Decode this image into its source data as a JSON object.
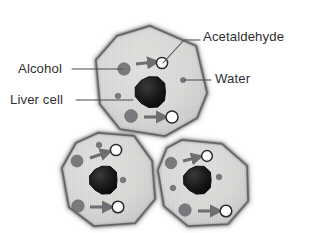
{
  "figure": {
    "background_color": "#ffffff",
    "top_clipped_text": "alcohol is broken down in liver cells",
    "label_color": "#2f2f33",
    "leader_color": "#4a4a50"
  },
  "labels": [
    {
      "id": "acetaldehyde",
      "text": "Acetaldehyde",
      "name": "label-acetaldehyde",
      "x": 203,
      "y": 41,
      "anchor": "start"
    },
    {
      "id": "water",
      "text": "Water",
      "name": "label-water",
      "x": 215,
      "y": 83,
      "anchor": "start"
    },
    {
      "id": "alcohol",
      "text": "Alcohol",
      "name": "label-alcohol",
      "x": 18,
      "y": 73,
      "anchor": "start"
    },
    {
      "id": "liver_cell",
      "text": "Liver cell",
      "name": "label-liver-cell",
      "x": 10,
      "y": 104,
      "anchor": "start"
    }
  ],
  "leaders": [
    {
      "id": "acetaldehyde-leader",
      "path": "M 163 63 L 184 40 L 200 40",
      "target": "acetaldehyde-molecule-top"
    },
    {
      "id": "water-leader",
      "path": "M 184 80 L 211 80",
      "target": "water-molecule-top"
    },
    {
      "id": "alcohol-leader",
      "path": "M 72 69 L 123 69",
      "target": "alcohol-molecule-top"
    },
    {
      "id": "liver-cell-leader",
      "path": "M 76 100 L 133 100",
      "target": "liver-cell-top"
    }
  ],
  "legend_meaning": {
    "alcohol": "large gray filled circle",
    "acetaldehyde": "white circle with dark outline",
    "water": "small gray filled circle",
    "nucleus": "large dark mottled blob",
    "arrow": "gray arrow showing conversion"
  },
  "colors": {
    "cell_fill": "#d5d5d3",
    "cell_fill_light": "#e3e3e1",
    "cell_outline": "#5a5a5c",
    "cell_outline_soft": "#8e8e90",
    "nucleus": "#1c1c1c",
    "nucleus_edge": "#0d0d0d",
    "molecule_gray": "#7a7a7e",
    "molecule_white": "#ffffff",
    "molecule_white_edge": "#2a2a2c",
    "arrow": "#6f6f73",
    "stripe": "#c8c8c6"
  },
  "cells": [
    {
      "id": "cell-top",
      "name": "liver-cell-top",
      "outline_path": "M 150 26 L 196 46 L 207 93 L 197 118 L 165 136 L 120 129 L 100 104 L 96 60 L 117 36 Z",
      "nucleus": {
        "cx": 151,
        "cy": 92,
        "r": 16
      },
      "molecules": [
        {
          "type": "alcohol",
          "name": "alcohol-molecule-top",
          "cx": 124,
          "cy": 69,
          "r": 6.2
        },
        {
          "type": "acetaldehyde",
          "name": "acetaldehyde-molecule-top",
          "cx": 162,
          "cy": 63,
          "r": 5.6
        },
        {
          "type": "water",
          "name": "water-molecule-top",
          "cx": 183,
          "cy": 80,
          "r": 2.6
        },
        {
          "type": "water",
          "name": "water-molecule-top-2",
          "cx": 118,
          "cy": 96,
          "r": 2.8
        },
        {
          "type": "alcohol",
          "name": "alcohol-molecule-top-2",
          "cx": 131,
          "cy": 116,
          "r": 6.4
        },
        {
          "type": "acetaldehyde",
          "name": "acetaldehyde-molecule-top-2",
          "cx": 172,
          "cy": 117,
          "r": 6.0
        }
      ],
      "arrows": [
        {
          "name": "conversion-arrow-top-1",
          "x1": 136,
          "y1": 64,
          "x2": 155,
          "y2": 62
        },
        {
          "name": "conversion-arrow-top-2",
          "x1": 144,
          "y1": 117,
          "x2": 164,
          "y2": 117
        }
      ]
    },
    {
      "id": "cell-bottom-left",
      "name": "liver-cell-bottom-left",
      "outline_path": "M 98 133 L 134 136 L 152 161 L 155 199 L 135 223 L 94 226 L 69 207 L 62 168 L 76 143 Z",
      "nucleus": {
        "cx": 104,
        "cy": 180,
        "r": 14.5
      },
      "molecules": [
        {
          "type": "water",
          "name": "water-molecule-bl-1",
          "cx": 99,
          "cy": 145,
          "r": 2.8
        },
        {
          "type": "acetaldehyde",
          "name": "acetaldehyde-molecule-bl-1",
          "cx": 116,
          "cy": 150,
          "r": 5.6
        },
        {
          "type": "alcohol",
          "name": "alcohol-molecule-bl-1",
          "cx": 77,
          "cy": 161,
          "r": 6.0
        },
        {
          "type": "water",
          "name": "water-molecule-bl-2",
          "cx": 123,
          "cy": 180,
          "r": 2.8
        },
        {
          "type": "alcohol",
          "name": "alcohol-molecule-bl-2",
          "cx": 78,
          "cy": 206,
          "r": 6.2
        },
        {
          "type": "acetaldehyde",
          "name": "acetaldehyde-molecule-bl-2",
          "cx": 118,
          "cy": 207,
          "r": 5.8
        }
      ],
      "arrows": [
        {
          "name": "conversion-arrow-bl-1",
          "x1": 90,
          "y1": 158,
          "x2": 108,
          "y2": 152
        },
        {
          "name": "conversion-arrow-bl-2",
          "x1": 90,
          "y1": 207,
          "x2": 110,
          "y2": 207
        }
      ]
    },
    {
      "id": "cell-bottom-right",
      "name": "liver-cell-bottom-right",
      "outline_path": "M 182 140 L 222 144 L 247 166 L 248 201 L 228 224 L 188 226 L 164 206 L 158 170 L 167 148 Z",
      "nucleus": {
        "cx": 198,
        "cy": 180,
        "r": 14.5
      },
      "molecules": [
        {
          "type": "alcohol",
          "name": "alcohol-molecule-br-1",
          "cx": 171,
          "cy": 163,
          "r": 5.8
        },
        {
          "type": "acetaldehyde",
          "name": "acetaldehyde-molecule-br-1",
          "cx": 207,
          "cy": 156,
          "r": 5.4
        },
        {
          "type": "water",
          "name": "water-molecule-br-1",
          "cx": 219,
          "cy": 177,
          "r": 2.8
        },
        {
          "type": "water",
          "name": "water-molecule-br-2",
          "cx": 173,
          "cy": 188,
          "r": 2.8
        },
        {
          "type": "alcohol",
          "name": "alcohol-molecule-br-2",
          "cx": 185,
          "cy": 210,
          "r": 6.2
        },
        {
          "type": "acetaldehyde",
          "name": "acetaldehyde-molecule-br-2",
          "cx": 226,
          "cy": 211,
          "r": 5.8
        }
      ],
      "arrows": [
        {
          "name": "conversion-arrow-br-1",
          "x1": 183,
          "y1": 161,
          "x2": 199,
          "y2": 157
        },
        {
          "name": "conversion-arrow-br-2",
          "x1": 198,
          "y1": 211,
          "x2": 218,
          "y2": 211
        }
      ]
    }
  ]
}
